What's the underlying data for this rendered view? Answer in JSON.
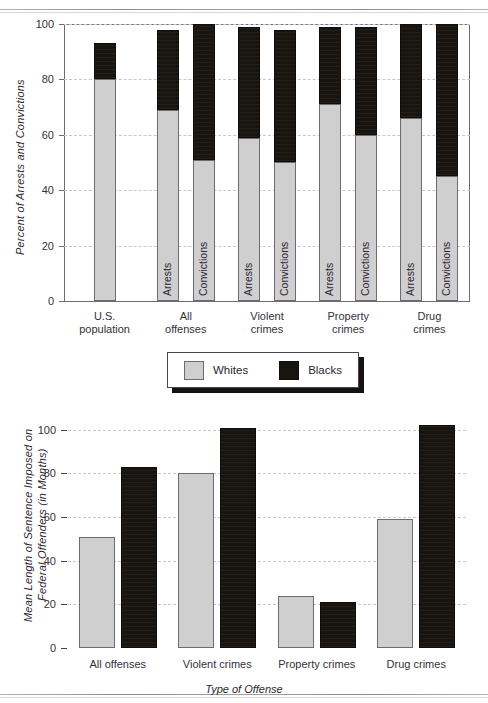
{
  "chart_data": [
    {
      "type": "bar",
      "subtype": "stacked",
      "id": "arrests-convictions",
      "title": "",
      "xlabel": "",
      "ylabel": "Percent of Arrests and Convictions",
      "ylim": [
        0,
        100
      ],
      "yticks": [
        0,
        20,
        40,
        60,
        80,
        100
      ],
      "grid": true,
      "legend_position": "below-chart-shared",
      "categories": [
        "U.S. population",
        "All offenses",
        "Violent crimes",
        "Property crimes",
        "Drug crimes"
      ],
      "group_labels": [
        "Arrests",
        "Convictions"
      ],
      "series": [
        {
          "name": "Whites",
          "color": "#cfcfcf"
        },
        {
          "name": "Blacks",
          "color": "#181410"
        }
      ],
      "bars": [
        {
          "category": "U.S. population",
          "measure": "",
          "show_measure_label": false,
          "whites": 80,
          "blacks": 13,
          "total": 93
        },
        {
          "category": "All offenses",
          "measure": "Arrests",
          "show_measure_label": true,
          "whites": 69,
          "blacks": 29,
          "total": 98
        },
        {
          "category": "All offenses",
          "measure": "Convictions",
          "show_measure_label": true,
          "whites": 51,
          "blacks": 49,
          "total": 100
        },
        {
          "category": "Violent crimes",
          "measure": "Arrests",
          "show_measure_label": true,
          "whites": 59,
          "blacks": 40,
          "total": 99
        },
        {
          "category": "Violent crimes",
          "measure": "Convictions",
          "show_measure_label": true,
          "whites": 50,
          "blacks": 48,
          "total": 98
        },
        {
          "category": "Property crimes",
          "measure": "Arrests",
          "show_measure_label": true,
          "whites": 71,
          "blacks": 28,
          "total": 99
        },
        {
          "category": "Property crimes",
          "measure": "Convictions",
          "show_measure_label": true,
          "whites": 60,
          "blacks": 39,
          "total": 99
        },
        {
          "category": "Drug crimes",
          "measure": "Arrests",
          "show_measure_label": true,
          "whites": 66,
          "blacks": 34,
          "total": 100
        },
        {
          "category": "Drug crimes",
          "measure": "Convictions",
          "show_measure_label": true,
          "whites": 45,
          "blacks": 55,
          "total": 100
        }
      ]
    },
    {
      "type": "bar",
      "subtype": "grouped",
      "id": "sentence-length",
      "title": "",
      "xlabel": "Type of Offense",
      "ylabel": "Mean Length of Sentence Imposed on Federal Offenders (in Months)",
      "ylim": [
        0,
        110
      ],
      "yticks": [
        0,
        20,
        40,
        60,
        80,
        100
      ],
      "grid": true,
      "categories": [
        "All offenses",
        "Violent crimes",
        "Property crimes",
        "Drug crimes"
      ],
      "series": [
        {
          "name": "Whites",
          "color": "#cfcfcf",
          "values": [
            51,
            80,
            24,
            59
          ]
        },
        {
          "name": "Blacks",
          "color": "#181410",
          "values": [
            83,
            101,
            21,
            102
          ]
        }
      ]
    }
  ],
  "legend": {
    "items": [
      {
        "label": "Whites",
        "color": "#cfcfcf",
        "swatch": "white-swatch"
      },
      {
        "label": "Blacks",
        "color": "#181410",
        "swatch": "black-swatch"
      }
    ]
  }
}
